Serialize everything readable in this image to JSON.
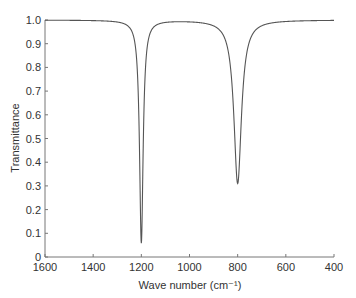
{
  "chart_data": {
    "type": "line",
    "title": "",
    "xlabel": "Wave number (cm⁻¹)",
    "ylabel": "Transmittance",
    "xlim": [
      1600,
      400
    ],
    "ylim": [
      0,
      1.0
    ],
    "x_reversed": true,
    "grid": false,
    "legend": null,
    "xticks": [
      1600,
      1400,
      1200,
      1000,
      800,
      600,
      400
    ],
    "xtick_labels": [
      "1600",
      "1400",
      "1200",
      "1000",
      "800",
      "600",
      "400"
    ],
    "yticks": [
      0,
      0.1,
      0.2,
      0.3,
      0.4,
      0.5,
      0.6,
      0.7,
      0.8,
      0.9,
      1.0
    ],
    "ytick_labels": [
      "0",
      "0.1",
      "0.2",
      "0.3",
      "0.4",
      "0.5",
      "0.6",
      "0.7",
      "0.8",
      "0.9",
      "1.0"
    ],
    "peaks": [
      {
        "x": 1200,
        "min_y": 0.06,
        "width": 18
      },
      {
        "x": 800,
        "min_y": 0.31,
        "width": 38
      }
    ],
    "series": [
      {
        "name": "Transmittance spectrum",
        "color": "#555555",
        "x": [
          1600,
          1500,
          1400,
          1350,
          1300,
          1270,
          1250,
          1230,
          1220,
          1210,
          1205,
          1200,
          1195,
          1190,
          1180,
          1170,
          1150,
          1120,
          1100,
          1050,
          1000,
          950,
          900,
          880,
          860,
          840,
          820,
          810,
          800,
          790,
          780,
          760,
          740,
          720,
          700,
          650,
          600,
          500,
          400
        ],
        "values": [
          1.0,
          0.995,
          0.99,
          0.98,
          0.96,
          0.93,
          0.88,
          0.75,
          0.6,
          0.35,
          0.16,
          0.06,
          0.16,
          0.35,
          0.6,
          0.75,
          0.88,
          0.95,
          0.97,
          0.98,
          0.975,
          0.96,
          0.92,
          0.88,
          0.8,
          0.67,
          0.47,
          0.37,
          0.31,
          0.37,
          0.47,
          0.67,
          0.8,
          0.88,
          0.92,
          0.96,
          0.98,
          0.99,
          1.0
        ]
      }
    ]
  }
}
